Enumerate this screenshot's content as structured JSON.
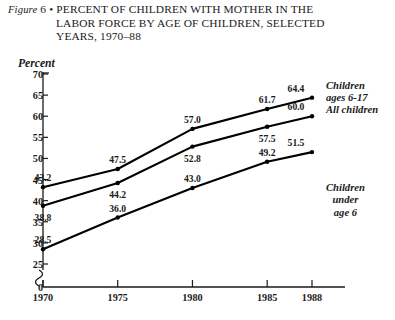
{
  "figure": {
    "label_prefix": "Figure",
    "number": "6",
    "bullet": "•",
    "title_line1": "PERCENT OF CHILDREN WITH MOTHER IN THE",
    "title_line2": "LABOR FORCE BY AGE OF CHILDREN, SELECTED",
    "title_line3": "YEARS, 1970–88"
  },
  "chart_data": {
    "type": "line",
    "xlabel": "",
    "ylabel": "Percent",
    "x": [
      1970,
      1975,
      1980,
      1985,
      1988
    ],
    "categories": [
      "1970",
      "1975",
      "1980",
      "1985",
      "1988"
    ],
    "xlim": [
      1970,
      1988
    ],
    "ylim": [
      25,
      70
    ],
    "yticks": [
      25,
      30,
      35,
      40,
      45,
      50,
      55,
      60,
      65,
      70
    ],
    "ytick_labels": [
      "25",
      "30",
      "35",
      "40",
      "45",
      "50",
      "55",
      "60",
      "65",
      "70"
    ],
    "zero_tick_label": "0",
    "axis_break": true,
    "grid": false,
    "legend_position": "right",
    "series": [
      {
        "name": "Children ages 6-17",
        "legend_line1": "Children",
        "legend_line2": "ages  6-17",
        "values": [
          43.2,
          47.5,
          57.0,
          61.7,
          64.4
        ],
        "labels": [
          "43.2",
          "47.5",
          "57.0",
          "61.7",
          "64.4"
        ]
      },
      {
        "name": "All children",
        "legend_line1": "All children",
        "legend_line2": "",
        "values": [
          38.8,
          44.2,
          52.8,
          57.5,
          60.0
        ],
        "labels": [
          "38.8",
          "44.2",
          "52.8",
          "57.5",
          "60.0"
        ]
      },
      {
        "name": "Children under age 6",
        "legend_line1": "Children",
        "legend_line2": "under",
        "legend_line3": "age  6",
        "values": [
          28.5,
          36.0,
          43.0,
          49.2,
          51.5
        ],
        "labels": [
          "28.5",
          "36.0",
          "43.0",
          "49.2",
          "51.5"
        ]
      }
    ],
    "colors": {
      "line": "#000000",
      "marker": "#000000",
      "axis": "#1a1a1a",
      "background": "#ffffff"
    }
  },
  "xaxis": {
    "ticks": [
      "1970",
      "1975",
      "1980",
      "1985",
      "1988"
    ]
  },
  "yaxis": {
    "title": "Percent",
    "ticks": [
      "70",
      "65",
      "60",
      "55",
      "50",
      "45",
      "40",
      "35",
      "30",
      "25",
      "0"
    ]
  }
}
